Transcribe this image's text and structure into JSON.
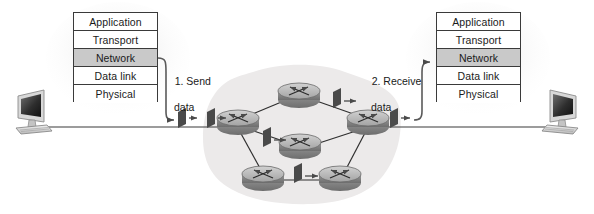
{
  "diagram": {
    "colors": {
      "stroke": "#3a3a3a",
      "text": "#1a1a1a",
      "highlight_row": "#c9c9c9",
      "cloud": "#eceaea",
      "router_top": "#b4b4b4",
      "router_side": "#8f8f8f",
      "packet": "#4a4a4a",
      "background": "#ffffff"
    }
  },
  "stack_left": {
    "name": "sending host protocol stack",
    "layers": [
      {
        "label": "Application",
        "highlighted": false
      },
      {
        "label": "Transport",
        "highlighted": false
      },
      {
        "label": "Network",
        "highlighted": true
      },
      {
        "label": "Data link",
        "highlighted": false
      },
      {
        "label": "Physical",
        "highlighted": false
      }
    ]
  },
  "stack_right": {
    "name": "receiving host protocol stack",
    "layers": [
      {
        "label": "Application",
        "highlighted": false
      },
      {
        "label": "Transport",
        "highlighted": false
      },
      {
        "label": "Network",
        "highlighted": true
      },
      {
        "label": "Data link",
        "highlighted": false
      },
      {
        "label": "Physical",
        "highlighted": false
      }
    ]
  },
  "labels": {
    "send": {
      "line1": "1. Send",
      "line2": "data"
    },
    "receive": {
      "line1": "2. Receive",
      "line2": "data"
    }
  },
  "hosts": [
    {
      "name": "sending-computer",
      "side": "left"
    },
    {
      "name": "receiving-computer",
      "side": "right"
    }
  ],
  "network": {
    "cloud_label": "",
    "routers": [
      {
        "id": "r-west",
        "x": 238,
        "y": 122
      },
      {
        "id": "r-north",
        "x": 299,
        "y": 95
      },
      {
        "id": "r-center",
        "x": 300,
        "y": 146
      },
      {
        "id": "r-east",
        "x": 368,
        "y": 122
      },
      {
        "id": "r-southwest",
        "x": 263,
        "y": 178
      },
      {
        "id": "r-southeast",
        "x": 340,
        "y": 178
      }
    ],
    "links": [
      {
        "from": "r-west",
        "to": "r-north"
      },
      {
        "from": "r-north",
        "to": "r-east"
      },
      {
        "from": "r-west",
        "to": "r-center"
      },
      {
        "from": "r-center",
        "to": "r-east"
      },
      {
        "from": "r-west",
        "to": "r-southwest"
      },
      {
        "from": "r-southwest",
        "to": "r-southeast"
      },
      {
        "from": "r-southeast",
        "to": "r-east"
      }
    ],
    "packets": [
      {
        "id": "pkt-host-1",
        "x": 180,
        "y": 120
      },
      {
        "id": "pkt-host-2",
        "x": 205,
        "y": 120
      },
      {
        "id": "pkt-west-center",
        "x": 268,
        "y": 140
      },
      {
        "id": "pkt-north-east",
        "x": 338,
        "y": 102
      },
      {
        "id": "pkt-south",
        "x": 300,
        "y": 176
      },
      {
        "id": "pkt-east-out",
        "x": 394,
        "y": 120
      }
    ]
  }
}
